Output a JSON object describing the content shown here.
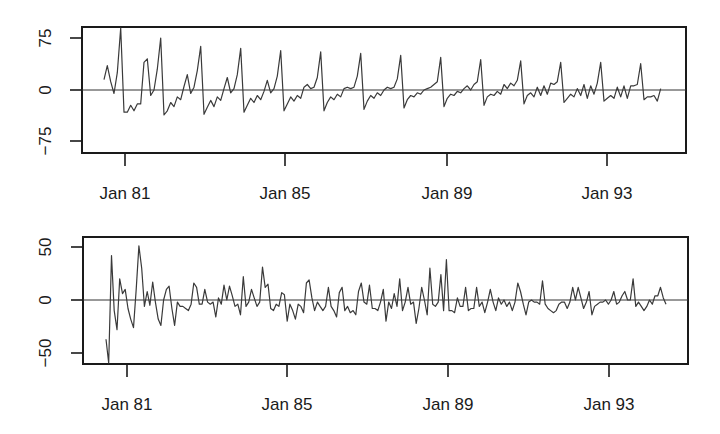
{
  "chart_data": [
    {
      "type": "line",
      "title": "",
      "xlabel": "",
      "ylabel": "",
      "x_tick_labels": [
        "Jan 81",
        "Jan 85",
        "Jan 89",
        "Jan 93"
      ],
      "y_tick_labels": [
        "75",
        "0",
        "-75"
      ],
      "y_ticks": [
        75,
        0,
        -75
      ],
      "ylim": [
        -95,
        100
      ],
      "start": "Jul 1980",
      "frequency": "monthly",
      "reference_line": 0,
      "grid": false,
      "values": [
        15,
        35,
        12,
        -5,
        25,
        90,
        -32,
        -32,
        -22,
        -30,
        -20,
        -20,
        40,
        45,
        -8,
        0,
        30,
        75,
        -36,
        -30,
        -18,
        -24,
        -10,
        -14,
        5,
        22,
        -5,
        4,
        28,
        63,
        -35,
        -25,
        -15,
        -24,
        -10,
        -15,
        2,
        18,
        -4,
        2,
        22,
        60,
        -32,
        -22,
        -12,
        -18,
        -8,
        -14,
        -2,
        14,
        -4,
        2,
        20,
        57,
        -30,
        -20,
        -10,
        -16,
        -8,
        -12,
        4,
        8,
        2,
        4,
        18,
        55,
        -30,
        -18,
        -10,
        -14,
        -6,
        -10,
        2,
        4,
        2,
        4,
        20,
        53,
        -28,
        -16,
        -8,
        -12,
        -4,
        -8,
        0,
        4,
        2,
        4,
        16,
        50,
        -26,
        -14,
        -8,
        -10,
        -4,
        -6,
        0,
        2,
        4,
        8,
        12,
        47,
        -24,
        -12,
        -6,
        -8,
        -2,
        -4,
        2,
        6,
        0,
        8,
        12,
        44,
        -22,
        -10,
        -6,
        -8,
        -2,
        -6,
        8,
        2,
        10,
        6,
        14,
        42,
        -20,
        -8,
        -4,
        -10,
        4,
        -8,
        6,
        -6,
        10,
        8,
        12,
        40,
        -18,
        -12,
        -6,
        -10,
        2,
        -8,
        8,
        -12,
        6,
        -6,
        10,
        40,
        -16,
        -12,
        -8,
        -12,
        4,
        -10,
        6,
        -12,
        6,
        6,
        8,
        38,
        -14,
        -10,
        -10,
        -8,
        -16,
        2
      ]
    },
    {
      "type": "line",
      "title": "",
      "xlabel": "",
      "ylabel": "",
      "x_tick_labels": [
        "Jan 81",
        "Jan 85",
        "Jan 89",
        "Jan 93"
      ],
      "y_tick_labels": [
        "50",
        "0",
        "-50"
      ],
      "y_ticks": [
        50,
        0,
        -50
      ],
      "ylim": [
        -60,
        57
      ],
      "start": "Aug 1980",
      "frequency": "monthly",
      "reference_line": 0,
      "grid": false,
      "values": [
        -37,
        -60,
        42,
        -10,
        -28,
        20,
        6,
        10,
        -8,
        -18,
        -26,
        10,
        51,
        30,
        -6,
        8,
        -5,
        17,
        -2,
        -18,
        -24,
        0,
        10,
        13,
        -8,
        -24,
        -2,
        -6,
        -6,
        -8,
        -10,
        -4,
        16,
        12,
        -4,
        -4,
        10,
        -2,
        -4,
        -2,
        -16,
        2,
        -4,
        14,
        0,
        13,
        4,
        -6,
        -4,
        -14,
        22,
        -6,
        -2,
        10,
        2,
        -6,
        -2,
        31,
        12,
        15,
        -8,
        -10,
        -4,
        -6,
        7,
        5,
        -20,
        -4,
        -10,
        -18,
        -4,
        -6,
        -12,
        16,
        19,
        2,
        -10,
        -2,
        -6,
        -10,
        -6,
        12,
        -6,
        -10,
        -16,
        7,
        12,
        -10,
        -6,
        -12,
        -10,
        -14,
        8,
        16,
        -2,
        -4,
        14,
        -8,
        -8,
        -10,
        -2,
        10,
        -20,
        -2,
        -8,
        6,
        -6,
        20,
        -10,
        -2,
        12,
        -4,
        -2,
        -22,
        -8,
        12,
        0,
        -14,
        30,
        -4,
        -6,
        -2,
        24,
        -10,
        38,
        -10,
        -10,
        -12,
        2,
        -6,
        -6,
        12,
        -10,
        -8,
        -8,
        12,
        -6,
        -2,
        -12,
        -2,
        10,
        -2,
        -10,
        2,
        -4,
        0,
        -6,
        -2,
        -10,
        -2,
        16,
        8,
        -4,
        -14,
        -2,
        0,
        -2,
        -2,
        -4,
        18,
        -4,
        -8,
        -10,
        -12,
        -10,
        -4,
        -2,
        -2,
        -8,
        -2,
        12,
        0,
        12,
        2,
        -8,
        -2,
        8,
        -14,
        -6,
        -4,
        -2,
        -2,
        0,
        -4,
        0,
        8,
        -4,
        -2,
        4,
        8,
        0,
        0,
        20,
        -6,
        -2,
        -6,
        -10,
        -6,
        0,
        -4,
        4,
        4,
        12,
        2,
        -4
      ]
    }
  ]
}
